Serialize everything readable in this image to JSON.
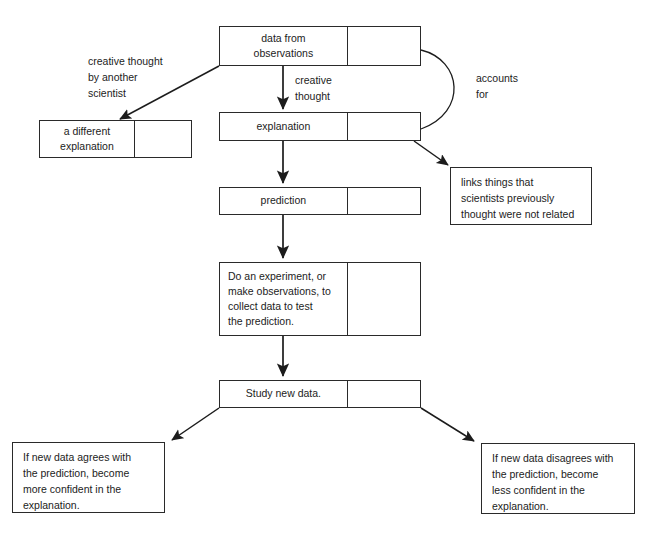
{
  "diagram": {
    "title_fragment": "",
    "colors": {
      "stroke": "#2a2a2a",
      "text": "#1c1c1c",
      "background": "#ffffff"
    },
    "nodes": [
      {
        "id": "data-from-observations",
        "label": "data from\nobservations"
      },
      {
        "id": "a-different-explanation",
        "label": "a different\nexplanation"
      },
      {
        "id": "explanation",
        "label": "explanation"
      },
      {
        "id": "prediction",
        "label": "prediction"
      },
      {
        "id": "do-an-experiment",
        "label": "Do an experiment, or\nmake observations, to\ncollect  data to test\nthe prediction."
      },
      {
        "id": "study-new-data",
        "label": "Study new data."
      },
      {
        "id": "links-things",
        "label": "links things that\nscientists previously\nthought were not related"
      },
      {
        "id": "agrees-outcome",
        "label": "If new data agrees with\nthe prediction, become\nmore confident in the\nexplanation."
      },
      {
        "id": "disagrees-outcome",
        "label": "If new data disagrees with\nthe prediction, become\nless confident in the\nexplanation."
      }
    ],
    "edge_labels": [
      {
        "id": "creative-thought-by-another-scientist",
        "text": "creative thought\nby another\nscientist"
      },
      {
        "id": "creative-thought",
        "text": "creative\nthought"
      },
      {
        "id": "accounts-for",
        "text": "accounts\nfor"
      }
    ]
  }
}
